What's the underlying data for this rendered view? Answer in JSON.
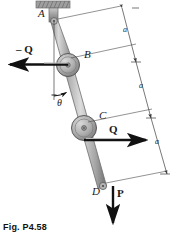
{
  "figure": {
    "caption": "Fig. P4.58",
    "points": {
      "a_label": "A",
      "b_label": "B",
      "c_label": "C",
      "d_label": "D"
    },
    "forces": {
      "minus_q": "– Q",
      "q": "Q",
      "p": "P"
    },
    "angle": {
      "theta": "θ"
    },
    "dimensions": {
      "seg1": "a",
      "seg2": "a",
      "seg3": "a"
    },
    "colors": {
      "link_fill": "#b7b7b7",
      "link_stroke": "#6b6b6b",
      "pulley_fill": "#a9a9a9",
      "pulley_stroke": "#5c5c5c",
      "support_fill": "#8f8f8f",
      "arrow": "#1a1a1a",
      "dim_line": "#4a4a4a"
    }
  }
}
